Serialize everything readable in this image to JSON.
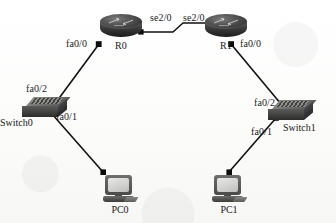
{
  "diagram": {
    "type": "network-topology",
    "background_color": "#fbfbfa",
    "line_color": "#111111",
    "device_color": "#3b3b3b"
  },
  "devices": [
    {
      "id": "r0",
      "name": "R0",
      "kind": "router",
      "x": 100,
      "y": 14
    },
    {
      "id": "r1",
      "name": "R1",
      "kind": "router",
      "x": 205,
      "y": 14
    },
    {
      "id": "switch0",
      "name": "Switch0",
      "kind": "switch",
      "x": 22,
      "y": 97
    },
    {
      "id": "switch1",
      "name": "Switch1",
      "kind": "switch",
      "x": 268,
      "y": 100
    },
    {
      "id": "pc0",
      "name": "PC0",
      "kind": "pc",
      "x": 103,
      "y": 175
    },
    {
      "id": "pc1",
      "name": "PC1",
      "kind": "pc",
      "x": 212,
      "y": 175
    }
  ],
  "interface_labels": [
    {
      "id": "r0-se20",
      "text": "se2/0",
      "x": 150,
      "y": 12,
      "for": "R0 serial"
    },
    {
      "id": "r1-se20",
      "text": "se2/0",
      "x": 183,
      "y": 12,
      "for": "R1 serial"
    },
    {
      "id": "r0-fa00",
      "text": "fa0/0",
      "x": 66,
      "y": 38,
      "for": "R0 fastethernet"
    },
    {
      "id": "r1-fa00",
      "text": "fa0/0",
      "x": 240,
      "y": 38,
      "for": "R1 fastethernet"
    },
    {
      "id": "sw0-fa02",
      "text": "fa0/2",
      "x": 26,
      "y": 83,
      "for": "Switch0 uplink"
    },
    {
      "id": "sw0-fa01",
      "text": "fa0/1",
      "x": 56,
      "y": 111,
      "for": "Switch0 access"
    },
    {
      "id": "sw1-fa02",
      "text": "fa0/2",
      "x": 254,
      "y": 97,
      "for": "Switch1 uplink"
    },
    {
      "id": "sw1-fa01",
      "text": "fa0/1",
      "x": 251,
      "y": 126,
      "for": "Switch1 access"
    }
  ],
  "device_labels": {
    "r0": "R0",
    "r1": "R1",
    "switch0": "Switch0",
    "switch1": "Switch1",
    "pc0": "PC0",
    "pc1": "PC1"
  },
  "links": [
    {
      "id": "link-r0-r1",
      "from": "R0",
      "to": "R1",
      "from_port": "se2/0",
      "to_port": "se2/0",
      "media": "serial"
    },
    {
      "id": "link-r0-sw0",
      "from": "R0",
      "to": "Switch0",
      "from_port": "fa0/0",
      "to_port": "fa0/2",
      "media": "ethernet"
    },
    {
      "id": "link-sw0-pc0",
      "from": "Switch0",
      "to": "PC0",
      "from_port": "fa0/1",
      "to_port": "",
      "media": "ethernet"
    },
    {
      "id": "link-r1-sw1",
      "from": "R1",
      "to": "Switch1",
      "from_port": "fa0/0",
      "to_port": "fa0/2",
      "media": "ethernet"
    },
    {
      "id": "link-sw1-pc1",
      "from": "Switch1",
      "to": "PC1",
      "from_port": "fa0/1",
      "to_port": "",
      "media": "ethernet"
    }
  ]
}
